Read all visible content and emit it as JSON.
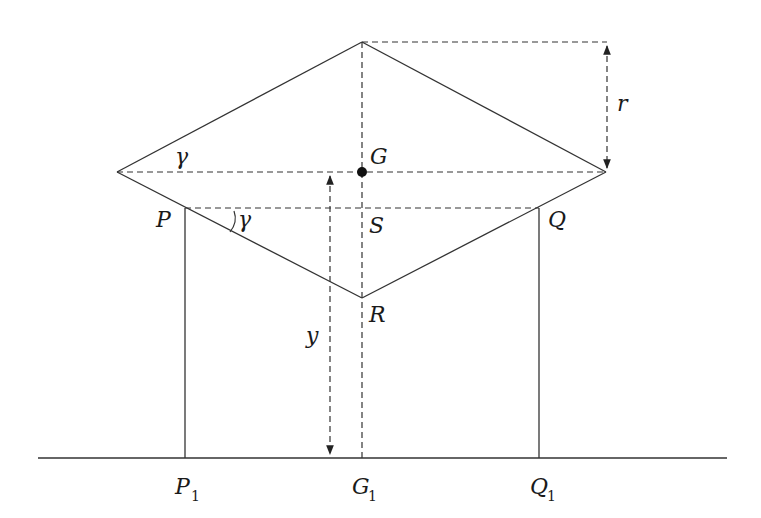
{
  "diagram": {
    "type": "geometric-figure",
    "colors": {
      "stroke": "#333333",
      "text": "#1a1a1a",
      "background": "#ffffff"
    },
    "labels": {
      "gamma_top": "γ",
      "G": "G",
      "r": "r",
      "P": "P",
      "gamma_P": "γ",
      "S": "S",
      "Q": "Q",
      "R": "R",
      "y": "y",
      "P1": "P",
      "P1_sub": "1",
      "G1": "G",
      "G1_sub": "1",
      "Q1": "Q",
      "Q1_sub": "1"
    },
    "points": {
      "top": [
        362,
        42
      ],
      "left": [
        117,
        172
      ],
      "right": [
        606,
        172
      ],
      "G": [
        362,
        172
      ],
      "P": [
        185,
        208
      ],
      "Q": [
        539,
        208
      ],
      "S": [
        362,
        208
      ],
      "R": [
        362,
        298
      ],
      "P1": [
        185,
        458
      ],
      "G1": [
        362,
        458
      ],
      "Q1": [
        539,
        458
      ]
    },
    "dimensions": [
      {
        "name": "r",
        "from": [
          607,
          42
        ],
        "to": [
          607,
          172
        ]
      },
      {
        "name": "y",
        "from": [
          330,
          172
        ],
        "to": [
          330,
          458
        ]
      }
    ],
    "ground_line": {
      "x1": 38,
      "x2": 727,
      "y": 458
    }
  }
}
